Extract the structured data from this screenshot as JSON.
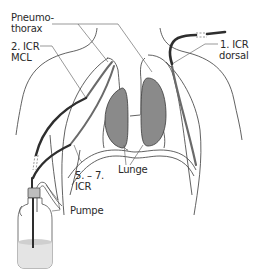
{
  "diagram": {
    "labels": {
      "pneumothorax_line1": "Pneumo-",
      "pneumothorax_line2": "thorax",
      "icr2_line1": "2. ICR",
      "icr2_line2": "MCL",
      "icr1_line1": "1. ICR",
      "icr1_line2": "dorsal",
      "icr57_line1": "5. – 7.",
      "icr57_line2": "ICR",
      "lunge": "Lunge",
      "pumpe": "Pumpe"
    },
    "colors": {
      "outline": "#3a3a3a",
      "lung_fill": "#8a8a8a",
      "drain_tube": "#2e2e2e",
      "drain_inside": "#7a7a7a",
      "fluid": "#cfcfcf",
      "background": "#ffffff"
    }
  }
}
